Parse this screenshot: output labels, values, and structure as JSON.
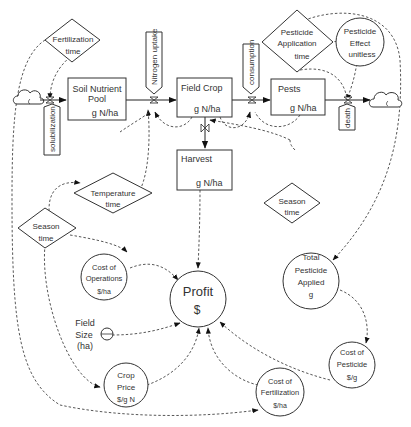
{
  "stocks": {
    "soil": {
      "name": "Soil Nutrient Pool",
      "line1": "Soil Nutrient",
      "line2": "Pool",
      "unit": "g N/ha"
    },
    "crop": {
      "name": "Field Crop",
      "unit": "g N/ha"
    },
    "pests": {
      "name": "Pests",
      "unit": "g N/ha"
    },
    "harvest": {
      "name": "Harvest",
      "unit": "g N/ha"
    }
  },
  "flows": {
    "solubilization": "solubilization",
    "nitrogen_uptake": "Nitrogen uptake",
    "consumption": "consumption",
    "death": "death"
  },
  "time_inputs": {
    "fertilization": {
      "line1": "Fertilization",
      "line2": "time"
    },
    "temperature": {
      "line1": "Temperature",
      "line2": "time"
    },
    "season_left": {
      "line1": "Season",
      "line2": "time"
    },
    "season_right": {
      "line1": "Season",
      "line2": "time"
    },
    "pesticide_app": {
      "line1": "Pesticide",
      "line2": "Application",
      "line3": "time"
    }
  },
  "converters": {
    "pesticide_effect": {
      "line1": "Pesticide",
      "line2": "Effect",
      "unit": "unitless"
    },
    "total_pesticide": {
      "line1": "Total",
      "line2": "Pesticide",
      "line3": "Applied",
      "unit": "g"
    },
    "cost_operations": {
      "line1": "Cost of",
      "line2": "Operations",
      "unit": "$/ha"
    },
    "profit": {
      "name": "Profit",
      "unit": "$"
    },
    "field_size": {
      "line1": "Field",
      "line2": "Size",
      "line3": "(ha)"
    },
    "crop_price": {
      "line1": "Crop",
      "line2": "Price",
      "unit": "$/g N"
    },
    "cost_fertilization": {
      "line1": "Cost of",
      "line2": "Fertilization",
      "unit": "$/ha"
    },
    "cost_pesticide": {
      "line1": "Cost of",
      "line2": "Pesticide",
      "unit": "$/g"
    }
  },
  "colors": {
    "stroke": "#333333",
    "background": "#ffffff"
  }
}
